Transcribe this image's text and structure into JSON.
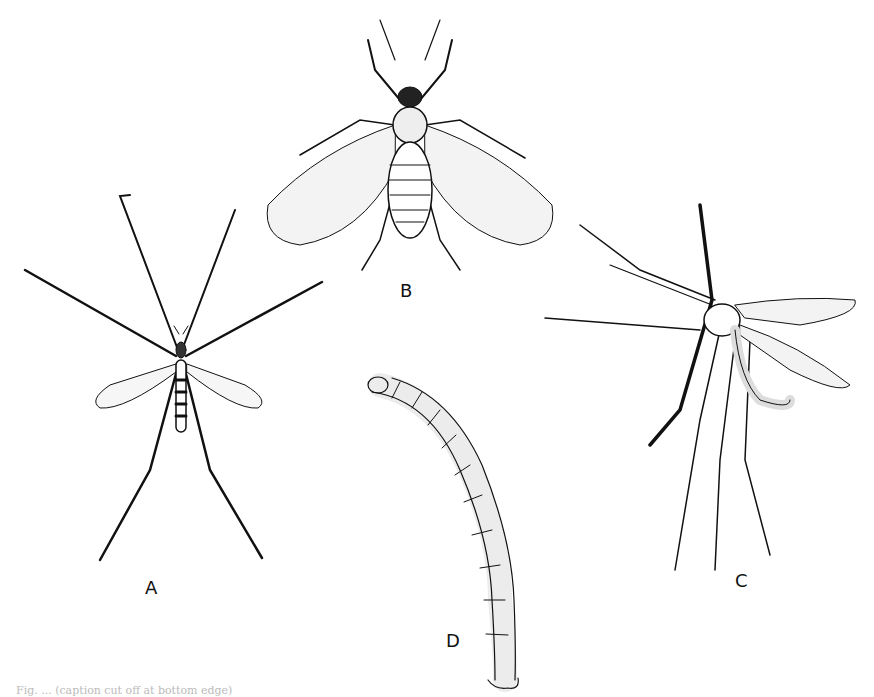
{
  "figure": {
    "labels": {
      "a": "A",
      "b": "B",
      "c": "C",
      "d": "D"
    },
    "caption": "Fig. ... (caption cut off at bottom edge)",
    "panels": [
      {
        "id": "A",
        "subject": "crane fly (top view, long legs, narrow spotted wings)"
      },
      {
        "id": "B",
        "subject": "small fly with broad hairy mottled wings (top view)"
      },
      {
        "id": "C",
        "subject": "mosquito-like fly (side view, long antennae and legs)"
      },
      {
        "id": "D",
        "subject": "segmented larva"
      }
    ],
    "colors": {
      "ink": "#111111",
      "background": "#ffffff"
    }
  }
}
